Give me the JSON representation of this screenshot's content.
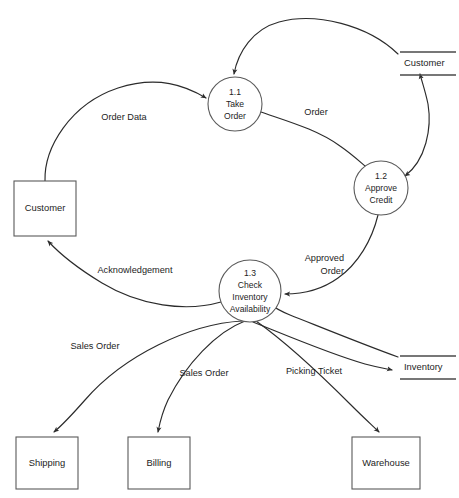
{
  "diagram": {
    "type": "data-flow-diagram",
    "title": "",
    "width": 459,
    "height": 498,
    "background_color": "#ffffff",
    "line_color": "#2b2b2b",
    "shape_stroke_color": "#5a5a5a",
    "text_color": "#1d1d1d"
  },
  "processes": [
    {
      "id": "p1_1",
      "number": "1.1",
      "line1": "Take",
      "line2": "Order",
      "cx": 235,
      "cy": 104,
      "r": 27
    },
    {
      "id": "p1_2",
      "number": "1.2",
      "line1": "Approve",
      "line2": "Credit",
      "cx": 381,
      "cy": 188,
      "r": 27
    },
    {
      "id": "p1_3",
      "number": "1.3",
      "line1": "Check",
      "line2": "Inventory",
      "line3": "Availability",
      "cx": 250,
      "cy": 291,
      "r": 31
    }
  ],
  "entities": [
    {
      "id": "e_customer",
      "label": "Customer",
      "x": 14,
      "y": 181,
      "w": 62,
      "h": 55
    },
    {
      "id": "e_shipping",
      "label": "Shipping",
      "x": 16,
      "y": 437,
      "w": 62,
      "h": 52
    },
    {
      "id": "e_billing",
      "label": "Billing",
      "x": 128,
      "y": 437,
      "w": 62,
      "h": 52
    },
    {
      "id": "e_warehouse",
      "label": "Warehouse",
      "x": 352,
      "y": 437,
      "w": 68,
      "h": 52
    }
  ],
  "data_stores": [
    {
      "id": "ds_customer",
      "label": "Customer",
      "x": 400,
      "y": 52,
      "w": 56
    },
    {
      "id": "ds_inventory",
      "label": "Inventory",
      "x": 400,
      "y": 366,
      "w": 56
    }
  ],
  "flows": [
    {
      "id": "f_order_data",
      "label": "Order Data",
      "from": "e_customer",
      "to": "p1_1",
      "label_x": 124,
      "label_y": 118,
      "anchor": "middle",
      "lines": [
        "Order Data"
      ]
    },
    {
      "id": "f_order",
      "label": "Order",
      "from": "p1_1",
      "to": "p1_2",
      "label_x": 316,
      "label_y": 113,
      "anchor": "middle",
      "lines": [
        "Order"
      ]
    },
    {
      "id": "f_cust_store_read",
      "label": "",
      "from": "ds_customer",
      "to": "p1_1",
      "label_x": 0,
      "label_y": 0,
      "anchor": "middle",
      "lines": []
    },
    {
      "id": "f_credit_check",
      "label": "",
      "from": "p1_2",
      "to": "ds_customer",
      "label_x": 0,
      "label_y": 0,
      "anchor": "middle",
      "lines": [],
      "bidirectional": true
    },
    {
      "id": "f_approved_order",
      "label": "Approved Order",
      "from": "p1_2",
      "to": "p1_3",
      "label_x": 344,
      "label_y": 265,
      "anchor": "end",
      "lines": [
        "Approved",
        "Order"
      ]
    },
    {
      "id": "f_acknowledgement",
      "label": "Acknowledgement",
      "from": "p1_3",
      "to": "e_customer",
      "label_x": 135,
      "label_y": 271,
      "anchor": "middle",
      "lines": [
        "Acknowledgement"
      ]
    },
    {
      "id": "f_sales_order_ship",
      "label": "Sales Order",
      "from": "p1_3",
      "to": "e_shipping",
      "label_x": 95,
      "label_y": 347,
      "anchor": "middle",
      "lines": [
        "Sales Order"
      ]
    },
    {
      "id": "f_sales_order_bill",
      "label": "Sales Order",
      "from": "p1_3",
      "to": "e_billing",
      "label_x": 204,
      "label_y": 374,
      "anchor": "middle",
      "lines": [
        "Sales Order"
      ]
    },
    {
      "id": "f_picking_ticket",
      "label": "Picking Ticket",
      "from": "p1_3",
      "to": "e_warehouse",
      "label_x": 314,
      "label_y": 372,
      "anchor": "middle",
      "lines": [
        "Picking Ticket"
      ]
    },
    {
      "id": "f_inventory_out",
      "label": "",
      "from": "p1_3",
      "to": "ds_inventory",
      "label_x": 0,
      "label_y": 0,
      "anchor": "middle",
      "lines": []
    },
    {
      "id": "f_inventory_in",
      "label": "",
      "from": "ds_inventory",
      "to": "p1_3",
      "label_x": 0,
      "label_y": 0,
      "anchor": "middle",
      "lines": []
    }
  ]
}
